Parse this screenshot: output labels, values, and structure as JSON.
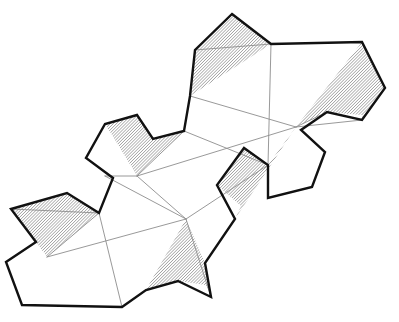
{
  "figure": {
    "canvas": {
      "width": 399,
      "height": 322
    },
    "background_color": "#ffffff",
    "outline_color": "#111111",
    "fold_line_color": "#8d8d8d",
    "hatch_color": "#6e6e6e",
    "hatch_background": "#ffffff",
    "outline_width": 2.4,
    "fold_line_width": 0.9
  },
  "geometry": {
    "outer_contour": "M 232,14 L 271,44 L 362,42 L 385,88 L 362,120 L 327,112 L 301,130 L 325,152 L 312,187 L 268,198 L 268,165 L 244,148 L 217,185 L 235,219 L 205,263 L 211,297 L 178,281 L 146,290 L 122,307 L 22,305 L 6,262 L 36,242 L 11,209 L 67,193 L 99,213 L 113,178 L 86,158 L 105,124 L 137,115 L 153,139 L 184,131 L 190,96 L 195,50 Z",
    "faces": [
      {
        "id": "face-top-hatched",
        "shaded": true,
        "points": "232,14 271,44 190,96 195,50"
      },
      {
        "id": "face-right-hatched",
        "shaded": true,
        "points": "362,42 385,88 362,120 327,112 296,127"
      },
      {
        "id": "face-mid-left-hatched",
        "shaded": true,
        "points": "153,139 184,131 137,176 105,124 137,115"
      },
      {
        "id": "face-mid-right-hatched",
        "shaded": true,
        "points": "268,165 244,148 217,185 235,219 296,127"
      },
      {
        "id": "face-bottom-left-hatched",
        "shaded": true,
        "points": "67,193 99,213 47,257 11,209"
      },
      {
        "id": "face-bottom-mid-hatched",
        "shaded": true,
        "points": "205,263 211,297 178,281 146,290 186,219"
      }
    ],
    "fold_lines": [
      "M 195,50 L 271,44",
      "M 190,96 L 296,127",
      "M 271,44 L 268,165",
      "M 327,112 L 296,127",
      "M 296,127 L 362,120",
      "M 137,176 L 296,127",
      "M 184,131 L 268,165",
      "M 137,176 L 184,131",
      "M 105,176 L 186,219",
      "M 47,257 L 186,219",
      "M 47,257 L 99,213",
      "M 11,209 L 99,213",
      "M 99,213 L 122,307",
      "M 137,176 L 186,219",
      "M 186,219 L 211,297",
      "M 268,165 L 186,219"
    ]
  },
  "hatch_pattern": {
    "name": "diagonal-45",
    "spacing_px": 2.2,
    "angle_deg": 45,
    "stroke_width": 0.85
  }
}
